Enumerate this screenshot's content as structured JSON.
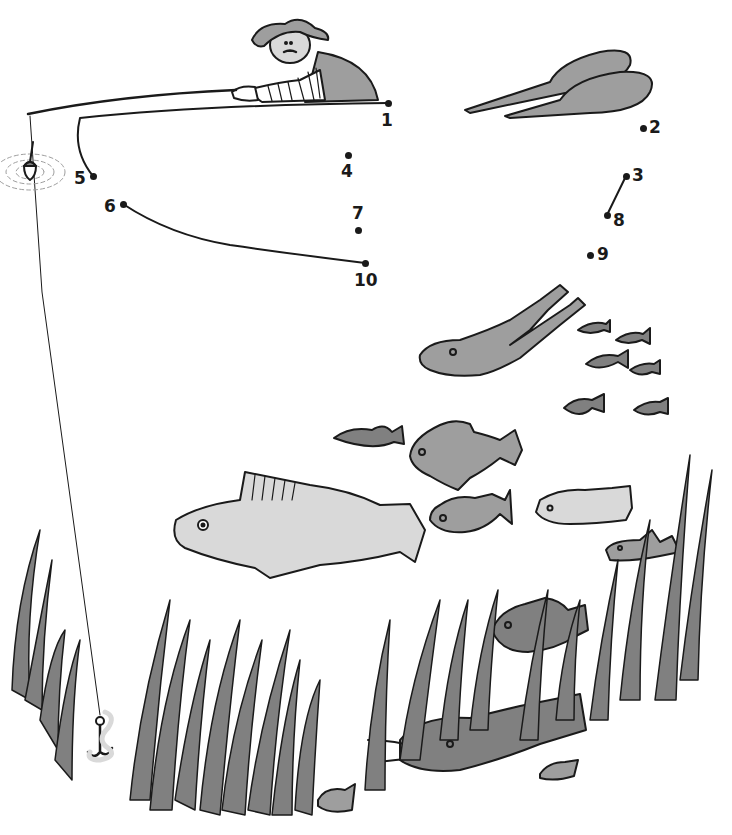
{
  "puzzle": {
    "type": "connect-the-dots",
    "colors": {
      "ink": "#1a1a1a",
      "light_grey": "#d9d9d9",
      "mid_grey": "#9e9e9e",
      "dark_grey": "#808080",
      "background": "#ffffff"
    },
    "dots": [
      {
        "n": "1",
        "x": 388,
        "y": 103,
        "lx": 381,
        "ly": 112
      },
      {
        "n": "2",
        "x": 643,
        "y": 128,
        "lx": 649,
        "ly": 119
      },
      {
        "n": "3",
        "x": 626,
        "y": 176,
        "lx": 632,
        "ly": 167
      },
      {
        "n": "4",
        "x": 348,
        "y": 155,
        "lx": 341,
        "ly": 163
      },
      {
        "n": "5",
        "x": 93,
        "y": 176,
        "lx": 74,
        "ly": 170
      },
      {
        "n": "6",
        "x": 123,
        "y": 204,
        "lx": 104,
        "ly": 198
      },
      {
        "n": "7",
        "x": 358,
        "y": 230,
        "lx": 352,
        "ly": 205
      },
      {
        "n": "8",
        "x": 607,
        "y": 215,
        "lx": 613,
        "ly": 212
      },
      {
        "n": "9",
        "x": 590,
        "y": 255,
        "lx": 597,
        "ly": 246
      },
      {
        "n": "10",
        "x": 365,
        "y": 263,
        "lx": 354,
        "ly": 272
      }
    ],
    "drawn_lines": [
      {
        "from": "1",
        "to": "5"
      },
      {
        "from": "6",
        "to": "10"
      },
      {
        "from": "3",
        "to": "8"
      }
    ]
  }
}
